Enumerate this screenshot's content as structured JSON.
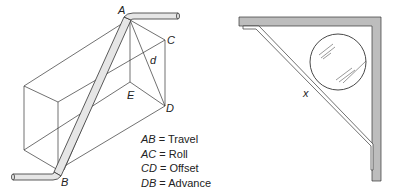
{
  "left_diagram": {
    "points": {
      "A": "A",
      "B": "B",
      "C": "C",
      "D": "D",
      "E": "E",
      "d": "d"
    },
    "legend": [
      {
        "key": "AB",
        "eq": " = ",
        "value": "Travel"
      },
      {
        "key": "AC",
        "eq": " = ",
        "value": "Roll"
      },
      {
        "key": "CD",
        "eq": " = ",
        "value": "Offset"
      },
      {
        "key": "DB",
        "eq": " = ",
        "value": "Advance"
      }
    ]
  },
  "right_diagram": {
    "label": "x"
  },
  "colors": {
    "line": "#333333",
    "wall_fill": "#bdbdbd",
    "pipe_fill": "#d8d8d8"
  }
}
